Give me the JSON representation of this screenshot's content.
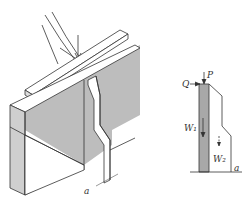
{
  "figure": {
    "type": "engineering-illustration",
    "colors": {
      "line": "#333333",
      "shade": "#bdbdbd",
      "shade_dark": "#a8a8a8",
      "background": "#ffffff"
    }
  },
  "left_view": {
    "description": "Isometric view of wall with buttress and top beam under load",
    "dimension_label": "a"
  },
  "right_view": {
    "description": "Side section of buttress with applied loads",
    "labels": {
      "P": "P",
      "Q": "Q",
      "W1": "W₁",
      "W2": "W₂",
      "a": "a"
    }
  }
}
